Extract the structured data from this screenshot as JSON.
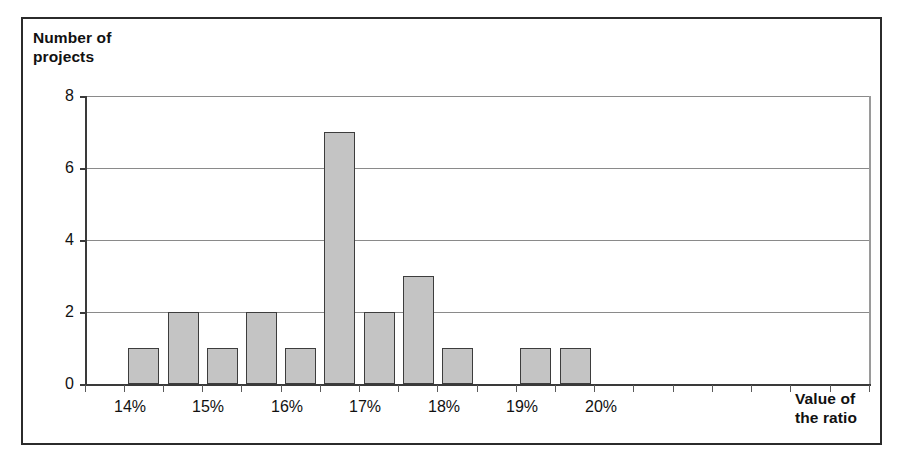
{
  "chart_data": {
    "type": "bar",
    "title": "",
    "subtitle": "",
    "xlabel": "Value of\nthe ratio",
    "ylabel": "Number of\nprojects",
    "ylim": [
      0,
      8
    ],
    "y_ticks": [
      "0",
      "2",
      "4",
      "6",
      "8"
    ],
    "y_tick_values": [
      0,
      2,
      4,
      6,
      8
    ],
    "grid": "horizontal",
    "legend": "none",
    "x_tick_labels": [
      "14%",
      "15%",
      "16%",
      "17%",
      "18%",
      "19%",
      "20%"
    ],
    "categories": [
      "14.0%",
      "14.5%",
      "15.0%",
      "15.5%",
      "16.0%",
      "16.5%",
      "17.0%",
      "17.5%",
      "18.0%",
      "18.5%",
      "19.0%",
      "19.5%",
      "20.0%",
      "20.5%"
    ],
    "values": [
      0,
      1,
      2,
      1,
      2,
      1,
      7,
      2,
      3,
      1,
      0,
      1,
      1,
      0
    ],
    "bars": [
      {
        "label": "14.5%",
        "value": 1
      },
      {
        "label": "15.0%",
        "value": 2
      },
      {
        "label": "15.5%",
        "value": 1
      },
      {
        "label": "16.0%",
        "value": 2
      },
      {
        "label": "16.5%",
        "value": 1
      },
      {
        "label": "17.0%",
        "value": 7
      },
      {
        "label": "17.5%",
        "value": 2
      },
      {
        "label": "18.0%",
        "value": 3
      },
      {
        "label": "18.5%",
        "value": 1
      },
      {
        "label": "19.5%",
        "value": 1
      },
      {
        "label": "20.0%",
        "value": 1
      }
    ],
    "colors": {
      "bar_fill": "#c4c4c4",
      "bar_stroke": "#3d3d3d",
      "grid": "#8a8a8a",
      "axis": "#3a3a3a",
      "text": "#111111",
      "frame": "#2b2b2b",
      "background": "#ffffff"
    }
  },
  "axis": {
    "y_title": "Number of\nprojects",
    "x_title": "Value of\nthe ratio",
    "y_tick_0": "0",
    "y_tick_2": "2",
    "y_tick_4": "4",
    "y_tick_6": "6",
    "y_tick_8": "8",
    "x_tick_14": "14%",
    "x_tick_15": "15%",
    "x_tick_16": "16%",
    "x_tick_17": "17%",
    "x_tick_18": "18%",
    "x_tick_19": "19%",
    "x_tick_20": "20%"
  }
}
